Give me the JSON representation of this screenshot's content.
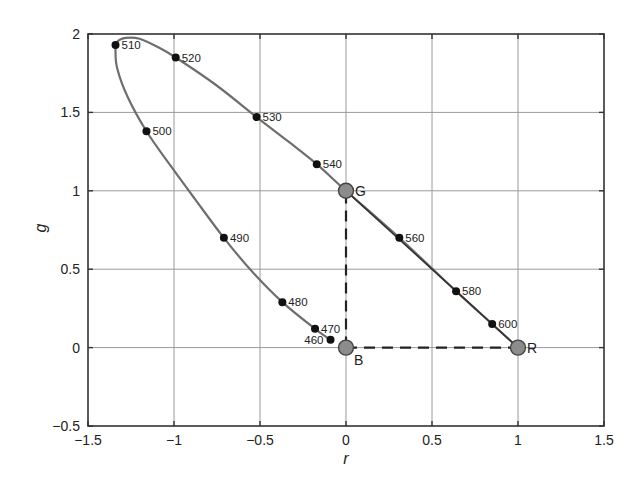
{
  "chart_data": {
    "type": "line",
    "title": "",
    "xlabel": "r",
    "ylabel": "g",
    "xlim": [
      -1.5,
      1.5
    ],
    "ylim": [
      -0.5,
      2
    ],
    "xticks": [
      -1.5,
      -1,
      -0.5,
      0,
      0.5,
      1,
      1.5
    ],
    "xtick_labels": [
      "−1.5",
      "−1",
      "−0.5",
      "0",
      "0.5",
      "1",
      "1.5"
    ],
    "yticks": [
      -0.5,
      0,
      0.5,
      1,
      1.5,
      2
    ],
    "ytick_labels": [
      "−0.5",
      "0",
      "0.5",
      "1",
      "1.5",
      "2"
    ],
    "grid": true,
    "legend": null,
    "spectral_locus": {
      "name": "spectrum locus",
      "color": "#6e6e6e",
      "curve": [
        [
          -0.09,
          0.05
        ],
        [
          -0.18,
          0.12
        ],
        [
          -0.37,
          0.29
        ],
        [
          -0.55,
          0.49
        ],
        [
          -0.71,
          0.7
        ],
        [
          -0.88,
          0.95
        ],
        [
          -1.02,
          1.16
        ],
        [
          -1.16,
          1.38
        ],
        [
          -1.27,
          1.6
        ],
        [
          -1.33,
          1.78
        ],
        [
          -1.34,
          1.9
        ],
        [
          -1.33,
          1.95
        ],
        [
          -1.28,
          1.975
        ],
        [
          -1.2,
          1.97
        ],
        [
          -1.1,
          1.92
        ],
        [
          -0.99,
          1.85
        ],
        [
          -0.75,
          1.67
        ],
        [
          -0.52,
          1.47
        ],
        [
          -0.33,
          1.31
        ],
        [
          -0.17,
          1.17
        ],
        [
          0,
          1
        ],
        [
          0.31,
          0.7
        ],
        [
          0.64,
          0.36
        ],
        [
          0.85,
          0.15
        ],
        [
          1,
          0
        ]
      ],
      "labeled_points": [
        {
          "label": "460",
          "r": -0.09,
          "g": 0.05,
          "label_side": "left"
        },
        {
          "label": "470",
          "r": -0.18,
          "g": 0.12,
          "label_side": "right"
        },
        {
          "label": "480",
          "r": -0.37,
          "g": 0.29,
          "label_side": "right"
        },
        {
          "label": "490",
          "r": -0.71,
          "g": 0.7,
          "label_side": "right"
        },
        {
          "label": "500",
          "r": -1.16,
          "g": 1.38,
          "label_side": "right"
        },
        {
          "label": "510",
          "r": -1.34,
          "g": 1.93,
          "label_side": "right"
        },
        {
          "label": "520",
          "r": -0.99,
          "g": 1.85,
          "label_side": "right"
        },
        {
          "label": "530",
          "r": -0.52,
          "g": 1.47,
          "label_side": "right"
        },
        {
          "label": "540",
          "r": -0.17,
          "g": 1.17,
          "label_side": "right"
        },
        {
          "label": "560",
          "r": 0.31,
          "g": 0.7,
          "label_side": "right"
        },
        {
          "label": "580",
          "r": 0.64,
          "g": 0.36,
          "label_side": "right"
        },
        {
          "label": "600",
          "r": 0.85,
          "g": 0.15,
          "label_side": "right"
        }
      ]
    },
    "primaries": [
      {
        "label": "G",
        "r": 0,
        "g": 1
      },
      {
        "label": "B",
        "r": 0,
        "g": 0
      },
      {
        "label": "R",
        "r": 1,
        "g": 0
      }
    ],
    "dashed_lines": [
      {
        "from": [
          0,
          0
        ],
        "to": [
          0,
          1
        ]
      },
      {
        "from": [
          0,
          0
        ],
        "to": [
          1,
          0
        ]
      }
    ],
    "colors": {
      "curve": "#6e6e6e",
      "point": "#111111",
      "primary_fill": "#8c8c8c",
      "primary_stroke": "#444444",
      "grid": "#9a9a9a",
      "axis": "#333333"
    }
  }
}
